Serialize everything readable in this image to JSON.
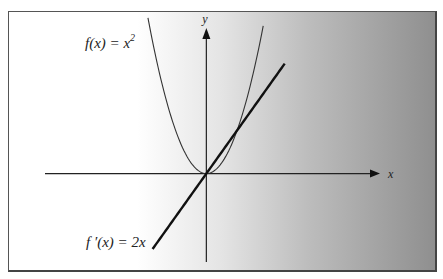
{
  "chart_data": {
    "type": "line",
    "title": "",
    "xlabel": "x",
    "ylabel": "y",
    "xlim": [
      -10.5,
      11.3
    ],
    "ylim": [
      -8.2,
      13.5
    ],
    "grid": false,
    "series": [
      {
        "name": "f(x) = x^2",
        "function": "x^2",
        "x_range": [
          -3.8,
          3.7
        ],
        "annotation_main": "f(x) = x",
        "annotation_sup": "2",
        "stroke": "#333333",
        "weight": "thin"
      },
      {
        "name": "f'(x) = 2x",
        "function": "2x",
        "x_range": [
          -3.5,
          5.1
        ],
        "annotation_main": "f ′(x) = 2x",
        "stroke": "#111111",
        "weight": "thick"
      }
    ],
    "colors": {
      "axis": "#222222",
      "frame": "#555555"
    }
  }
}
